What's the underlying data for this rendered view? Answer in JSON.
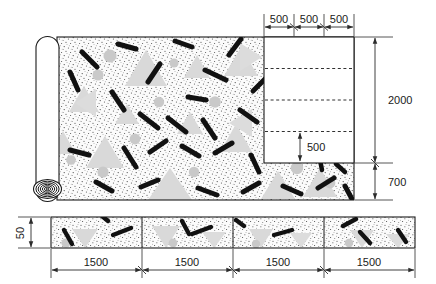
{
  "drawing": {
    "title": "Fiber-reinforced sheet roll layout",
    "units": "mm",
    "colors": {
      "outline": "#1a1a1a",
      "dimension": "#2b2b2b",
      "fiber": "#111111",
      "aggregate_triangle": "#d9d9d9",
      "aggregate_circle": "#c9c9c9",
      "stipple": "#3a3a3a",
      "panel_fill": "#ffffff",
      "sheet_fill": "#fbfbfb",
      "background": "#ffffff"
    }
  },
  "top_dimensions": {
    "name": "top-dimension-chain",
    "segments": [
      {
        "label": "500"
      },
      {
        "label": "500"
      },
      {
        "label": "500"
      }
    ]
  },
  "right_dimensions": {
    "name": "right-dimension-chain",
    "segments": [
      {
        "label": "2000"
      },
      {
        "label": "700"
      }
    ]
  },
  "inner_dimension": {
    "name": "inner-band-dimension",
    "label": "500"
  },
  "section_dimension": {
    "name": "section-thickness-dimension",
    "label": "50"
  },
  "bottom_dimensions": {
    "name": "bottom-dimension-chain",
    "segments": [
      {
        "label": "1500"
      },
      {
        "label": "1500"
      },
      {
        "label": "1500"
      },
      {
        "label": "1500"
      }
    ]
  },
  "panel": {
    "name": "white-overlay-panel",
    "dashed_divider_count": 3
  },
  "roll": {
    "name": "rolled-sheet-end",
    "spiral_rings": 7
  },
  "strip": {
    "name": "section-strip",
    "segment_count": 4
  }
}
